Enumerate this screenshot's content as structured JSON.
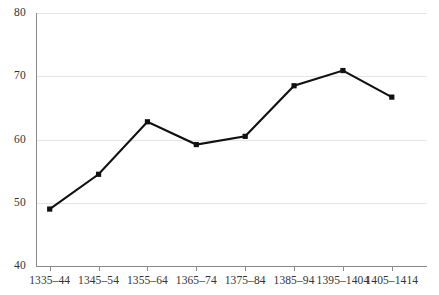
{
  "chart_data": {
    "type": "line",
    "title": "",
    "subtitle": "",
    "xlabel": "",
    "ylabel": "",
    "categories": [
      "1335–44",
      "1345–54",
      "1355–64",
      "1365–74",
      "1375–84",
      "1385–94",
      "1395–1404",
      "1405–1414"
    ],
    "values": [
      49.0,
      54.5,
      62.8,
      59.2,
      60.5,
      68.5,
      70.9,
      66.7
    ],
    "series": [
      {
        "name": "",
        "values": [
          49.0,
          54.5,
          62.8,
          59.2,
          60.5,
          68.5,
          70.9,
          66.7
        ]
      }
    ],
    "ylim": [
      40,
      80
    ],
    "yticks": [
      40,
      50,
      60,
      70,
      80
    ],
    "ytick_labels": [
      "40",
      "50",
      "60",
      "70",
      "80"
    ],
    "grid": true,
    "grid_axis": "y",
    "legend": false,
    "legend_position": "none",
    "marker": "square",
    "line_color": "#111111",
    "grid_color": "#e4e4e4",
    "axis_color": "#8a8a8a",
    "background_color": "#ffffff",
    "annotations": []
  },
  "axis": {
    "y": {
      "ticks": [
        {
          "label": "80",
          "value": 80
        },
        {
          "label": "70",
          "value": 70
        },
        {
          "label": "60",
          "value": 60
        },
        {
          "label": "50",
          "value": 50
        },
        {
          "label": "40",
          "value": 40
        }
      ]
    },
    "x": {
      "ticks": [
        {
          "label": "1335–44"
        },
        {
          "label": "1345–54"
        },
        {
          "label": "1355–64"
        },
        {
          "label": "1365–74"
        },
        {
          "label": "1375–84"
        },
        {
          "label": "1385–94"
        },
        {
          "label": "1395–1404"
        },
        {
          "label": "1405–1414"
        }
      ]
    }
  }
}
